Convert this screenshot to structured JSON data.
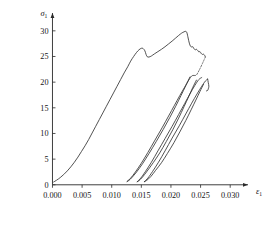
{
  "chart_data": {
    "type": "line",
    "title": "",
    "subtitle": "",
    "xlabel": "ε",
    "xlabel_sub": "1",
    "ylabel": "σ",
    "ylabel_sub": "1",
    "xlim": [
      -0.0016,
      0.0325
    ],
    "ylim": [
      -1.6,
      32.5
    ],
    "xticks": [
      0.0,
      0.005,
      0.01,
      0.015,
      0.02,
      0.025,
      0.03
    ],
    "xtick_labels": [
      "0.000",
      "0.005",
      "0.010",
      "0.015",
      "0.020",
      "0.025",
      "0.030"
    ],
    "yticks": [
      0,
      5,
      10,
      15,
      20,
      25,
      30
    ],
    "ytick_labels": [
      "0",
      "5",
      "10",
      "15",
      "20",
      "25",
      "30"
    ],
    "grid": false,
    "legend": null,
    "axis_arrows": true,
    "series": [
      {
        "name": "monotonic-loading-envelope",
        "style": "solid",
        "points": [
          [
            0.0002,
            0.55
          ],
          [
            0.0007,
            0.9
          ],
          [
            0.0013,
            1.4
          ],
          [
            0.0019,
            2.0
          ],
          [
            0.0025,
            2.7
          ],
          [
            0.0031,
            3.5
          ],
          [
            0.0037,
            4.4
          ],
          [
            0.0043,
            5.4
          ],
          [
            0.0049,
            6.5
          ],
          [
            0.0055,
            7.6
          ],
          [
            0.0061,
            8.8
          ],
          [
            0.0067,
            10.1
          ],
          [
            0.0073,
            11.4
          ],
          [
            0.0079,
            12.7
          ],
          [
            0.0085,
            14.0
          ],
          [
            0.0091,
            15.3
          ],
          [
            0.0097,
            16.6
          ],
          [
            0.0103,
            17.9
          ],
          [
            0.0109,
            19.2
          ],
          [
            0.0115,
            20.5
          ],
          [
            0.0121,
            21.8
          ],
          [
            0.0127,
            23.0
          ],
          [
            0.0132,
            24.1
          ],
          [
            0.0137,
            25.0
          ],
          [
            0.0142,
            25.8
          ],
          [
            0.0146,
            26.3
          ],
          [
            0.015,
            26.6
          ],
          [
            0.0153,
            26.55
          ],
          [
            0.0156,
            26.1
          ],
          [
            0.0158,
            25.4
          ],
          [
            0.016,
            24.95
          ],
          [
            0.0163,
            24.9
          ],
          [
            0.0167,
            25.1
          ],
          [
            0.0172,
            25.5
          ],
          [
            0.0178,
            25.95
          ],
          [
            0.0184,
            26.4
          ],
          [
            0.019,
            26.9
          ],
          [
            0.0196,
            27.45
          ],
          [
            0.0202,
            28.0
          ],
          [
            0.0208,
            28.6
          ],
          [
            0.0213,
            29.1
          ],
          [
            0.0218,
            29.55
          ],
          [
            0.0222,
            29.8
          ],
          [
            0.0225,
            29.9
          ],
          [
            0.0227,
            29.6
          ],
          [
            0.0229,
            28.6
          ],
          [
            0.0231,
            27.6
          ],
          [
            0.0233,
            27.0
          ],
          [
            0.0235,
            26.85
          ],
          [
            0.0237,
            26.9
          ],
          [
            0.0239,
            26.5
          ],
          [
            0.0241,
            26.3
          ],
          [
            0.0243,
            26.4
          ],
          [
            0.0245,
            26.2
          ],
          [
            0.0247,
            25.9
          ],
          [
            0.0249,
            25.95
          ],
          [
            0.0251,
            25.6
          ],
          [
            0.0253,
            25.4
          ],
          [
            0.0255,
            25.45
          ],
          [
            0.0257,
            25.2
          ],
          [
            0.0258,
            24.9
          ]
        ]
      },
      {
        "name": "unload-cycle-1",
        "style": "solid",
        "points": [
          [
            0.0232,
            21.0
          ],
          [
            0.0225,
            19.3
          ],
          [
            0.0217,
            17.4
          ],
          [
            0.0208,
            15.3
          ],
          [
            0.0198,
            13.1
          ],
          [
            0.0187,
            10.8
          ],
          [
            0.0175,
            8.4
          ],
          [
            0.0163,
            6.1
          ],
          [
            0.0152,
            4.1
          ],
          [
            0.0142,
            2.5
          ],
          [
            0.0134,
            1.4
          ],
          [
            0.0129,
            0.85
          ],
          [
            0.0126,
            0.65
          ]
        ]
      },
      {
        "name": "reload-cycle-1",
        "style": "solid",
        "points": [
          [
            0.0126,
            0.65
          ],
          [
            0.0132,
            1.3
          ],
          [
            0.014,
            2.5
          ],
          [
            0.015,
            4.2
          ],
          [
            0.0161,
            6.3
          ],
          [
            0.0173,
            8.7
          ],
          [
            0.0185,
            11.1
          ],
          [
            0.0196,
            13.4
          ],
          [
            0.0206,
            15.5
          ],
          [
            0.0215,
            17.4
          ],
          [
            0.0223,
            19.0
          ],
          [
            0.023,
            20.4
          ],
          [
            0.0235,
            21.2
          ],
          [
            0.0239,
            21.3
          ]
        ]
      },
      {
        "name": "unload-cycle-2",
        "style": "solid",
        "points": [
          [
            0.0243,
            20.4
          ],
          [
            0.0237,
            19.0
          ],
          [
            0.023,
            17.2
          ],
          [
            0.0222,
            15.2
          ],
          [
            0.0213,
            13.0
          ],
          [
            0.0203,
            10.7
          ],
          [
            0.0192,
            8.4
          ],
          [
            0.0181,
            6.2
          ],
          [
            0.017,
            4.3
          ],
          [
            0.016,
            2.7
          ],
          [
            0.0152,
            1.5
          ],
          [
            0.0146,
            0.8
          ],
          [
            0.0143,
            0.6
          ]
        ]
      },
      {
        "name": "reload-cycle-2",
        "style": "solid",
        "points": [
          [
            0.0143,
            0.6
          ],
          [
            0.0149,
            1.3
          ],
          [
            0.0157,
            2.6
          ],
          [
            0.0167,
            4.4
          ],
          [
            0.0178,
            6.6
          ],
          [
            0.019,
            9.0
          ],
          [
            0.0202,
            11.4
          ],
          [
            0.0213,
            13.7
          ],
          [
            0.0223,
            15.8
          ],
          [
            0.0232,
            17.7
          ],
          [
            0.024,
            19.3
          ],
          [
            0.0247,
            20.5
          ],
          [
            0.0252,
            20.9
          ]
        ]
      },
      {
        "name": "unload-cycle-3",
        "style": "solid",
        "points": [
          [
            0.0255,
            19.6
          ],
          [
            0.0249,
            18.2
          ],
          [
            0.0242,
            16.5
          ],
          [
            0.0234,
            14.6
          ],
          [
            0.0225,
            12.5
          ],
          [
            0.0215,
            10.3
          ],
          [
            0.0205,
            8.2
          ],
          [
            0.0194,
            6.1
          ],
          [
            0.0184,
            4.3
          ],
          [
            0.0174,
            2.8
          ],
          [
            0.0166,
            1.6
          ],
          [
            0.0159,
            0.85
          ],
          [
            0.0155,
            0.6
          ]
        ]
      },
      {
        "name": "reload-cycle-3",
        "style": "solid",
        "points": [
          [
            0.0155,
            0.6
          ],
          [
            0.0161,
            1.3
          ],
          [
            0.0169,
            2.6
          ],
          [
            0.0179,
            4.4
          ],
          [
            0.019,
            6.6
          ],
          [
            0.0202,
            9.1
          ],
          [
            0.0214,
            11.5
          ],
          [
            0.0225,
            13.8
          ],
          [
            0.0235,
            15.9
          ],
          [
            0.0244,
            17.7
          ],
          [
            0.0252,
            19.2
          ],
          [
            0.0258,
            20.2
          ],
          [
            0.0262,
            20.6
          ]
        ]
      },
      {
        "name": "final-descent",
        "style": "solid",
        "points": [
          [
            0.0262,
            20.6
          ],
          [
            0.0263,
            19.9
          ],
          [
            0.0264,
            19.2
          ],
          [
            0.0263,
            18.7
          ],
          [
            0.0262,
            18.4
          ],
          [
            0.026,
            18.3
          ]
        ]
      },
      {
        "name": "transition-dashed",
        "style": "dashed",
        "points": [
          [
            0.0258,
            24.9
          ],
          [
            0.0253,
            23.6
          ],
          [
            0.0248,
            22.4
          ],
          [
            0.0243,
            21.4
          ],
          [
            0.0239,
            21.3
          ]
        ]
      }
    ]
  }
}
